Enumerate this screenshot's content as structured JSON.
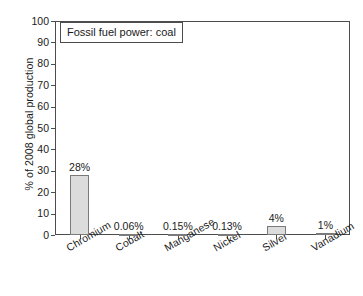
{
  "chart_data": {
    "type": "bar",
    "title": "Fossil fuel power: coal",
    "xlabel": "",
    "ylabel": "% of 2008 global production",
    "ylim": [
      0,
      100
    ],
    "yticks": [
      0,
      10,
      20,
      30,
      40,
      50,
      60,
      70,
      80,
      90,
      100
    ],
    "grid": false,
    "legend_position": "upper-left-inside-box",
    "categories": [
      "Chromium",
      "Cobalt",
      "Manganese",
      "Nickel",
      "Silver",
      "Vanadium"
    ],
    "values": [
      28,
      0.06,
      0.15,
      0.13,
      4,
      1
    ],
    "value_labels": [
      "28%",
      "0.06%",
      "0.15%",
      "0.13%",
      "4%",
      "1%"
    ],
    "series": [
      {
        "name": "Fossil fuel power: coal",
        "values": [
          28,
          0.06,
          0.15,
          0.13,
          4,
          1
        ]
      }
    ]
  },
  "colors": {
    "bar_fill": "#dcdcdc",
    "bar_border": "#7a7a7a",
    "axis": "#4d4d4d",
    "text": "#1a1a1a",
    "background": "#ffffff"
  },
  "ytick_labels": [
    "0",
    "10",
    "20",
    "30",
    "40",
    "50",
    "60",
    "70",
    "80",
    "90",
    "100"
  ]
}
